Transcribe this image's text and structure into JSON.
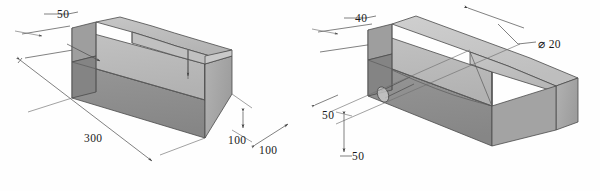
{
  "sheet": {
    "background_color": "#fefefe",
    "line_color": "#3a3a3a",
    "dimension_line_color": "#4a4a4a",
    "text_color": "#1a1a1a"
  },
  "figures": [
    {
      "id": "left-figure",
      "name": "isometric-block-left",
      "description": "Isometric rectangular block with sloped top cut",
      "face_colors": {
        "top": "#c8c8c8",
        "front_upper": "#bdbdbd",
        "front_lower": "#8e8e8e",
        "right_end": "#a8a8a8",
        "left_end_upper": "#9a9a9a",
        "left_end_lower": "#7e7e7e",
        "slope": "#b5b5b5"
      },
      "dimensions": [
        {
          "id": "left-width-50",
          "label": "50",
          "kind": "leader"
        },
        {
          "id": "left-length-300",
          "label": "300",
          "kind": "linear"
        },
        {
          "id": "left-height-100",
          "label": "100",
          "kind": "linear-vertical"
        },
        {
          "id": "left-depth-100",
          "label": "100",
          "kind": "linear-diagonal"
        }
      ]
    },
    {
      "id": "right-figure",
      "name": "isometric-block-right",
      "description": "Isometric rectangular block with chamfered top and through hole",
      "face_colors": {
        "top": "#c8c8c8",
        "front_upper": "#bdbdbd",
        "front_lower": "#8e8e8e",
        "right_end": "#a8a8a8",
        "left_end_upper": "#9a9a9a",
        "left_end_lower": "#7e7e7e",
        "slope": "#b5b5b5"
      },
      "dimensions": [
        {
          "id": "right-width-40",
          "label": "40",
          "kind": "leader"
        },
        {
          "id": "right-offset-50",
          "label": "50",
          "kind": "leader"
        },
        {
          "id": "right-height-50",
          "label": "50",
          "kind": "linear-vertical"
        },
        {
          "id": "right-hole-dia",
          "label": "⌀ 20",
          "kind": "leader-diameter"
        }
      ]
    }
  ],
  "labels": {
    "left_50": "50",
    "left_300": "300",
    "left_100_height": "100",
    "left_100_depth": "100",
    "right_40": "40",
    "right_50_upper": "50",
    "right_50_lower": "50",
    "right_dia_20": "⌀ 20"
  }
}
